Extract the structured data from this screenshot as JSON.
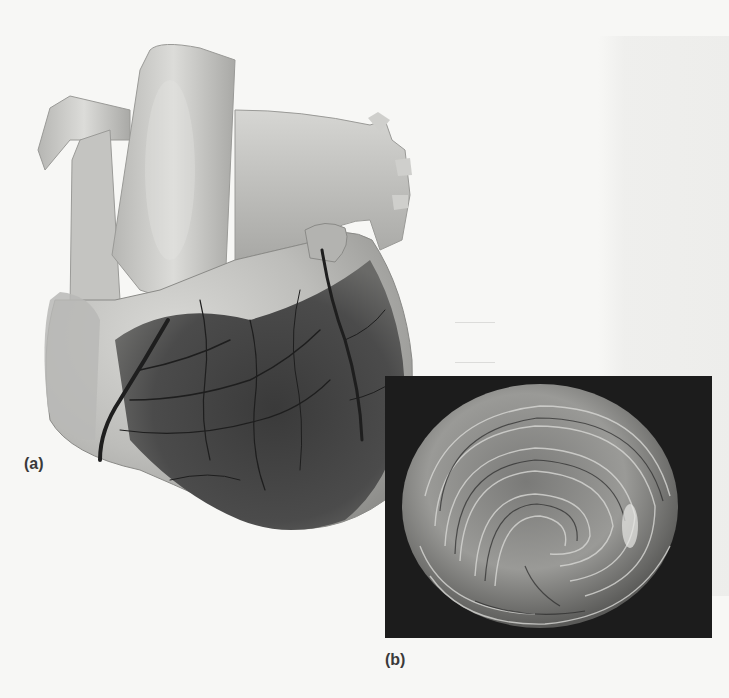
{
  "figure": {
    "panel_a": {
      "label": "(a)",
      "subject": "anterior view of human heart with coronary vessels"
    },
    "panel_b": {
      "label": "(b)",
      "subject": "spiral arrangement of ventricular muscle fibers"
    }
  },
  "colors": {
    "background": "#f7f7f5",
    "inset_background": "#1c1c1c",
    "label_text": "#3a3a3a"
  }
}
